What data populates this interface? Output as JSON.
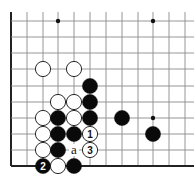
{
  "board": {
    "cols_x": [
      11,
      27,
      43,
      58,
      74,
      90,
      106,
      122,
      138,
      153,
      169,
      185
    ],
    "rows_y": [
      21,
      37,
      53,
      69,
      86,
      102,
      118,
      134,
      150,
      166
    ],
    "line_top": 12,
    "line_right": 194,
    "left_edge": true,
    "bottom_edge": true,
    "stone_radius": 7.6,
    "line_color": "#8a8a8a",
    "edge_color": "#222222",
    "star_points": [
      {
        "c": 3,
        "r": 0
      },
      {
        "c": 9,
        "r": 0
      },
      {
        "c": 9,
        "r": 6
      }
    ],
    "stones": [
      {
        "c": 2,
        "r": 3,
        "color": "white",
        "label": ""
      },
      {
        "c": 4,
        "r": 3,
        "color": "white",
        "label": ""
      },
      {
        "c": 5,
        "r": 4,
        "color": "black",
        "label": ""
      },
      {
        "c": 3,
        "r": 5,
        "color": "white",
        "label": ""
      },
      {
        "c": 4,
        "r": 5,
        "color": "white",
        "label": ""
      },
      {
        "c": 5,
        "r": 5,
        "color": "black",
        "label": ""
      },
      {
        "c": 2,
        "r": 6,
        "color": "white",
        "label": ""
      },
      {
        "c": 3,
        "r": 6,
        "color": "black",
        "label": ""
      },
      {
        "c": 4,
        "r": 6,
        "color": "white",
        "label": ""
      },
      {
        "c": 5,
        "r": 6,
        "color": "black",
        "label": ""
      },
      {
        "c": 7,
        "r": 6,
        "color": "black",
        "label": ""
      },
      {
        "c": 2,
        "r": 7,
        "color": "white",
        "label": ""
      },
      {
        "c": 3,
        "r": 7,
        "color": "black",
        "label": ""
      },
      {
        "c": 4,
        "r": 7,
        "color": "black",
        "label": ""
      },
      {
        "c": 5,
        "r": 7,
        "color": "white",
        "label": "1"
      },
      {
        "c": 9,
        "r": 7,
        "color": "black",
        "label": ""
      },
      {
        "c": 2,
        "r": 8,
        "color": "white",
        "label": ""
      },
      {
        "c": 3,
        "r": 8,
        "color": "black",
        "label": ""
      },
      {
        "c": 5,
        "r": 8,
        "color": "white",
        "label": "3"
      },
      {
        "c": 2,
        "r": 9,
        "color": "black",
        "label": "2"
      },
      {
        "c": 3,
        "r": 9,
        "color": "white",
        "label": ""
      },
      {
        "c": 4,
        "r": 9,
        "color": "black",
        "label": ""
      }
    ],
    "marks": [
      {
        "c": 4,
        "r": 8,
        "text": "a"
      }
    ]
  }
}
